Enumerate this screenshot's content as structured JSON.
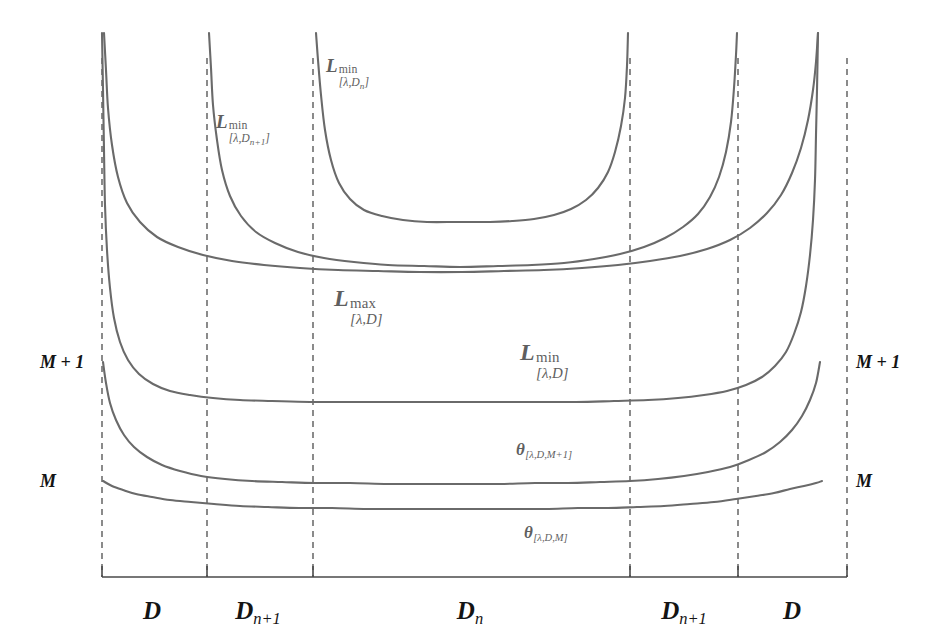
{
  "figure": {
    "background_color": "#ffffff",
    "curve_color": "#6a6a6a",
    "guide_color": "#4d4d4d",
    "axis_color": "#4a4a4a",
    "label_color": "#5f5f5f",
    "axis_label_color": "#141414"
  },
  "axis": {
    "y_baseline": 577,
    "x_start": 102,
    "x_end": 847,
    "tick_height": 11,
    "tick_positions": [
      102,
      207,
      313,
      630,
      738,
      847
    ]
  },
  "guides": {
    "y_top": 58,
    "y_bottom": 577,
    "x_positions": [
      102,
      207,
      313,
      630,
      738,
      847
    ]
  },
  "region_labels": [
    {
      "name": "region-D-left",
      "text": "D",
      "sub": "",
      "x": 152,
      "y": 598
    },
    {
      "name": "region-Dn1-left",
      "text": "D",
      "sub": "n+1",
      "x": 258,
      "y": 598
    },
    {
      "name": "region-Dn-center",
      "text": "D",
      "sub": "n",
      "x": 470,
      "y": 598
    },
    {
      "name": "region-Dn1-right",
      "text": "D",
      "sub": "n+1",
      "x": 684,
      "y": 598
    },
    {
      "name": "region-D-right",
      "text": "D",
      "sub": "",
      "x": 792,
      "y": 598
    }
  ],
  "side_labels": [
    {
      "name": "left-value-m-plus-1",
      "text": "M + 1",
      "x": 40,
      "y": 362,
      "align": "right"
    },
    {
      "name": "left-value-m",
      "text": "M",
      "x": 40,
      "y": 481,
      "align": "right"
    },
    {
      "name": "right-value-m-plus-1",
      "text": "M + 1",
      "x": 856,
      "y": 362,
      "align": "left"
    },
    {
      "name": "right-value-m",
      "text": "M",
      "x": 856,
      "y": 481,
      "align": "left"
    }
  ],
  "curve_labels": [
    {
      "name": "label-lmin-dn",
      "base": "L",
      "sup": "min",
      "sub": "[λ,D",
      "sub_tail": "]",
      "sub_index": "n",
      "x": 326,
      "y": 56,
      "size": 19
    },
    {
      "name": "label-lmin-dn1",
      "base": "L",
      "sup": "min",
      "sub": "[λ,D",
      "sub_tail": "]",
      "sub_index": "n+1",
      "x": 216,
      "y": 112,
      "size": 19
    },
    {
      "name": "label-lmax-d",
      "base": "L",
      "sup": "max",
      "sub": "[λ,D",
      "sub_tail": "]",
      "sub_index": "",
      "x": 334,
      "y": 286,
      "size": 24
    },
    {
      "name": "label-lmin-d",
      "base": "L",
      "sup": "min",
      "sub": "[λ,D",
      "sub_tail": "]",
      "sub_index": "",
      "x": 520,
      "y": 340,
      "size": 24
    }
  ],
  "theta_labels": [
    {
      "name": "label-theta-m-plus-1",
      "base": "θ",
      "sub": "[λ,D,M+1]",
      "x": 516,
      "y": 441,
      "size": 17
    },
    {
      "name": "label-theta-m",
      "base": "θ",
      "sub": "[λ,D,M]",
      "x": 524,
      "y": 524,
      "size": 17
    }
  ],
  "chart_data": {
    "type": "line",
    "title": "",
    "xlabel": "",
    "ylabel": "",
    "grid": false,
    "legend_position": "inline-annotations",
    "x_axis": {
      "kind": "categorical-regions",
      "boundaries_px": [
        102,
        207,
        313,
        630,
        738,
        847
      ],
      "region_names": [
        "D",
        "D_{n+1}",
        "D_n",
        "D_{n+1}",
        "D"
      ]
    },
    "y_axis": {
      "kind": "ordinal-markers",
      "tick_labels": [
        "M",
        "M + 1"
      ],
      "tick_pixels": [
        481,
        362
      ],
      "direction": "increasing-upward"
    },
    "series": [
      {
        "name": "L^min_{[λ,D_n]}",
        "label": "L min [lambda, D_n]",
        "asymptote_left_px": 313,
        "asymptote_right_px": 630,
        "plateau_px": 222,
        "points_px": [
          [
            316,
            33
          ],
          [
            318,
            60
          ],
          [
            321,
            95
          ],
          [
            325,
            130
          ],
          [
            331,
            160
          ],
          [
            339,
            183
          ],
          [
            350,
            199
          ],
          [
            364,
            210
          ],
          [
            382,
            216
          ],
          [
            403,
            220
          ],
          [
            427,
            222
          ],
          [
            455,
            222
          ],
          [
            471,
            222
          ],
          [
            490,
            222
          ],
          [
            512,
            221
          ],
          [
            534,
            219
          ],
          [
            554,
            215
          ],
          [
            571,
            209
          ],
          [
            586,
            200
          ],
          [
            598,
            188
          ],
          [
            608,
            172
          ],
          [
            615,
            152
          ],
          [
            621,
            126
          ],
          [
            625,
            98
          ],
          [
            627,
            66
          ],
          [
            628,
            33
          ]
        ]
      },
      {
        "name": "L^min_{[λ,D_{n+1}]}",
        "label": "L min [lambda, D_{n+1}]",
        "asymptote_left_px": 207,
        "asymptote_right_px": 738,
        "plateau_px": 267,
        "points_px": [
          [
            209,
            33
          ],
          [
            211,
            68
          ],
          [
            213,
            105
          ],
          [
            217,
            140
          ],
          [
            222,
            170
          ],
          [
            230,
            196
          ],
          [
            241,
            216
          ],
          [
            256,
            232
          ],
          [
            275,
            243
          ],
          [
            298,
            252
          ],
          [
            324,
            258
          ],
          [
            354,
            262
          ],
          [
            388,
            265
          ],
          [
            424,
            266
          ],
          [
            460,
            267
          ],
          [
            498,
            266
          ],
          [
            532,
            265
          ],
          [
            564,
            263
          ],
          [
            594,
            259
          ],
          [
            620,
            254
          ],
          [
            644,
            247
          ],
          [
            665,
            238
          ],
          [
            683,
            227
          ],
          [
            698,
            214
          ],
          [
            710,
            197
          ],
          [
            719,
            177
          ],
          [
            726,
            152
          ],
          [
            731,
            122
          ],
          [
            734,
            88
          ],
          [
            736,
            55
          ],
          [
            737,
            33
          ]
        ]
      },
      {
        "name": "L^max_{[λ,D]}",
        "label": "L max [lambda, D]",
        "asymptote_left_px": 102,
        "asymptote_right_px": 847,
        "plateau_px": 272,
        "points_px": [
          [
            104,
            33
          ],
          [
            106,
            70
          ],
          [
            108,
            108
          ],
          [
            112,
            145
          ],
          [
            118,
            177
          ],
          [
            127,
            203
          ],
          [
            140,
            222
          ],
          [
            157,
            237
          ],
          [
            178,
            247
          ],
          [
            203,
            255
          ],
          [
            232,
            261
          ],
          [
            264,
            265
          ],
          [
            300,
            268
          ],
          [
            338,
            270
          ],
          [
            378,
            271
          ],
          [
            420,
            272
          ],
          [
            462,
            272
          ],
          [
            504,
            271
          ],
          [
            544,
            270
          ],
          [
            582,
            268
          ],
          [
            618,
            265
          ],
          [
            650,
            261
          ],
          [
            680,
            256
          ],
          [
            707,
            249
          ],
          [
            730,
            240
          ],
          [
            750,
            228
          ],
          [
            767,
            213
          ],
          [
            781,
            195
          ],
          [
            792,
            173
          ],
          [
            801,
            148
          ],
          [
            808,
            120
          ],
          [
            813,
            90
          ],
          [
            816,
            62
          ],
          [
            818,
            33
          ]
        ]
      },
      {
        "name": "L^min_{[λ,D]}",
        "label": "L min [lambda, D]",
        "asymptote_left_px": 102,
        "plateau_px": 400,
        "left_value_px": 362,
        "right_value_px": 362,
        "points_px": [
          [
            102,
            33
          ],
          [
            103,
            90
          ],
          [
            104,
            150
          ],
          [
            105,
            205
          ],
          [
            107,
            250
          ],
          [
            110,
            288
          ],
          [
            114,
            318
          ],
          [
            120,
            342
          ],
          [
            128,
            360
          ],
          [
            139,
            374
          ],
          [
            153,
            384
          ],
          [
            170,
            391
          ],
          [
            190,
            395
          ],
          [
            213,
            398
          ],
          [
            240,
            400
          ],
          [
            272,
            401
          ],
          [
            310,
            402
          ],
          [
            352,
            402
          ],
          [
            398,
            402
          ],
          [
            444,
            402
          ],
          [
            490,
            402
          ],
          [
            534,
            402
          ],
          [
            576,
            402
          ],
          [
            614,
            401
          ],
          [
            648,
            400
          ],
          [
            678,
            398
          ],
          [
            704,
            395
          ],
          [
            727,
            391
          ],
          [
            746,
            385
          ],
          [
            762,
            377
          ],
          [
            775,
            366
          ],
          [
            786,
            352
          ],
          [
            794,
            334
          ],
          [
            801,
            312
          ],
          [
            806,
            286
          ],
          [
            810,
            255
          ],
          [
            813,
            220
          ],
          [
            815,
            180
          ],
          [
            816,
            135
          ],
          [
            817,
            90
          ],
          [
            818,
            33
          ]
        ]
      },
      {
        "name": "θ_{[λ,D,M+1]}",
        "label": "theta [lambda, D, M+1]",
        "left_value_px": 362,
        "right_value_px": 362,
        "plateau_px": 483,
        "points_px": [
          [
            103,
            362
          ],
          [
            106,
            383
          ],
          [
            110,
            403
          ],
          [
            116,
            420
          ],
          [
            124,
            435
          ],
          [
            134,
            447
          ],
          [
            147,
            457
          ],
          [
            162,
            465
          ],
          [
            180,
            471
          ],
          [
            201,
            476
          ],
          [
            225,
            479
          ],
          [
            252,
            481
          ],
          [
            282,
            482
          ],
          [
            315,
            483
          ],
          [
            350,
            483
          ],
          [
            388,
            484
          ],
          [
            426,
            484
          ],
          [
            464,
            484
          ],
          [
            500,
            484
          ],
          [
            535,
            483
          ],
          [
            568,
            483
          ],
          [
            600,
            482
          ],
          [
            630,
            481
          ],
          [
            658,
            479
          ],
          [
            684,
            476
          ],
          [
            708,
            472
          ],
          [
            730,
            467
          ],
          [
            749,
            460
          ],
          [
            766,
            452
          ],
          [
            780,
            442
          ],
          [
            792,
            430
          ],
          [
            802,
            416
          ],
          [
            810,
            400
          ],
          [
            816,
            383
          ],
          [
            820,
            362
          ]
        ]
      },
      {
        "name": "θ_{[λ,D,M]}",
        "label": "theta [lambda, D, M]",
        "left_value_px": 481,
        "right_value_px": 481,
        "plateau_px": 508,
        "points_px": [
          [
            103,
            481
          ],
          [
            112,
            486
          ],
          [
            123,
            490
          ],
          [
            136,
            494
          ],
          [
            152,
            497
          ],
          [
            170,
            500
          ],
          [
            191,
            502
          ],
          [
            214,
            504
          ],
          [
            240,
            506
          ],
          [
            268,
            507
          ],
          [
            299,
            508
          ],
          [
            332,
            508
          ],
          [
            367,
            509
          ],
          [
            403,
            509
          ],
          [
            440,
            509
          ],
          [
            477,
            509
          ],
          [
            512,
            509
          ],
          [
            546,
            509
          ],
          [
            578,
            508
          ],
          [
            608,
            508
          ],
          [
            637,
            507
          ],
          [
            664,
            506
          ],
          [
            690,
            504
          ],
          [
            714,
            502
          ],
          [
            736,
            499
          ],
          [
            756,
            496
          ],
          [
            774,
            493
          ],
          [
            790,
            489
          ],
          [
            804,
            486
          ],
          [
            816,
            483
          ],
          [
            822,
            481
          ]
        ]
      }
    ]
  }
}
